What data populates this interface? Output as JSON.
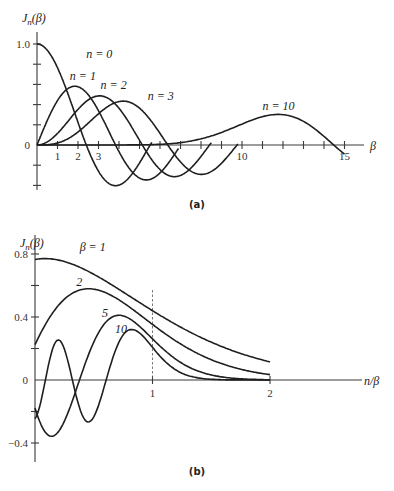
{
  "chart_data": [
    {
      "id": "a",
      "type": "line",
      "caption": "(a)",
      "ylabel": "J_n(β)",
      "ylabel_parts": {
        "main": "J",
        "sub": "n",
        "arg": "(β)"
      },
      "xlabel": "β",
      "xlim": [
        0,
        15.5
      ],
      "ylim": [
        -0.42,
        1.0
      ],
      "x_tick_labels": [
        {
          "v": 1,
          "t": "1"
        },
        {
          "v": 2,
          "t": "2"
        },
        {
          "v": 3,
          "t": "3"
        },
        {
          "v": 10,
          "t": "10"
        },
        {
          "v": 15,
          "t": "15"
        }
      ],
      "x_ticks_minor_every": 1,
      "y_tick_labels": [
        {
          "v": 0,
          "t": "0"
        },
        {
          "v": 1.0,
          "t": "1.0"
        }
      ],
      "y_ticks_minor_every": 0.2,
      "grid": false,
      "series": [
        {
          "name": "n = 0",
          "order": 0,
          "x_range": [
            0,
            5.6
          ],
          "peak": {
            "x": 0,
            "y": 1.0
          }
        },
        {
          "name": "n = 1",
          "order": 1,
          "x_range": [
            0,
            6.9
          ],
          "peak": {
            "x": 1.84,
            "y": 0.58
          }
        },
        {
          "name": "n = 2",
          "order": 2,
          "x_range": [
            0,
            8.5
          ],
          "peak": {
            "x": 3.05,
            "y": 0.49
          }
        },
        {
          "name": "n = 3",
          "order": 3,
          "x_range": [
            0,
            9.8
          ],
          "peak": {
            "x": 4.2,
            "y": 0.43
          }
        },
        {
          "name": "n = 10",
          "order": 10,
          "x_range": [
            0,
            15
          ],
          "peak": {
            "x": 11.8,
            "y": 0.27
          }
        }
      ],
      "annotations": [
        {
          "text": "n = 0",
          "x": 2.4,
          "y": 0.86
        },
        {
          "text": "n = 1",
          "x": 1.6,
          "y": 0.64
        },
        {
          "text": "n = 2",
          "x": 3.1,
          "y": 0.55
        },
        {
          "text": "n = 3",
          "x": 5.4,
          "y": 0.45
        },
        {
          "text": "n = 10",
          "x": 11.0,
          "y": 0.35
        }
      ]
    },
    {
      "id": "b",
      "type": "line",
      "caption": "(b)",
      "ylabel": "J_n(β)",
      "ylabel_parts": {
        "main": "J",
        "sub": "n",
        "arg": "(β)"
      },
      "xlabel": "n/β",
      "xlim": [
        0,
        2.6
      ],
      "ylim": [
        -0.55,
        0.95
      ],
      "x_tick_labels": [
        {
          "v": 1,
          "t": "1"
        },
        {
          "v": 2,
          "t": "2"
        }
      ],
      "y_tick_labels": [
        {
          "v": 0.8,
          "t": "0.8"
        },
        {
          "v": 0.4,
          "t": "0.4"
        },
        {
          "v": 0,
          "t": "0"
        },
        {
          "v": -0.4,
          "t": "-0.4"
        }
      ],
      "y_ticks_minor_every": 0.2,
      "reference_line": {
        "x": 1,
        "style": "dashed"
      },
      "grid": false,
      "series": [
        {
          "name": "β = 1",
          "beta": 1,
          "x_range": [
            0,
            2
          ],
          "y_at_0": 0.77
        },
        {
          "name": "2",
          "beta": 2,
          "x_range": [
            0,
            2
          ],
          "y_at_0": 0.22
        },
        {
          "name": "5",
          "beta": 5,
          "x_range": [
            0,
            2
          ],
          "y_at_0": -0.18
        },
        {
          "name": "10",
          "beta": 10,
          "x_range": [
            0,
            2
          ],
          "y_at_0": -0.25
        }
      ],
      "annotations": [
        {
          "text": "β = 1",
          "x": 0.38,
          "y": 0.82
        },
        {
          "text": "2",
          "x": 0.35,
          "y": 0.6
        },
        {
          "text": "5",
          "x": 0.57,
          "y": 0.4
        },
        {
          "text": "10",
          "x": 0.68,
          "y": 0.3
        }
      ]
    }
  ]
}
